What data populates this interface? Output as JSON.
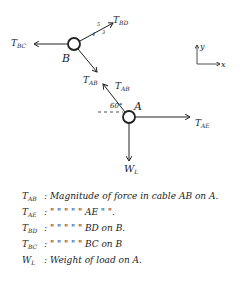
{
  "diagram": {
    "nodes": {
      "B": {
        "label": "B"
      },
      "A": {
        "label": "A"
      }
    },
    "forces_B": {
      "T_BD": {
        "main": "T",
        "sub": "BD"
      },
      "T_BC": {
        "main": "T",
        "sub": "BC"
      },
      "T_AB": {
        "main": "T",
        "sub": "AB"
      },
      "slope": {
        "rise": "3",
        "run": "4",
        "hyp": "5"
      }
    },
    "forces_A": {
      "T_AB": {
        "main": "T",
        "sub": "AB"
      },
      "T_AE": {
        "main": "T",
        "sub": "AE"
      },
      "W_L": {
        "main": "W",
        "sub": "L"
      },
      "angle": "60°"
    },
    "axes": {
      "x": "x",
      "y": "y"
    }
  },
  "legend": [
    {
      "sym": "T",
      "sub": "AB",
      "text": ": Magnitude of force in cable AB on A."
    },
    {
      "sym": "T",
      "sub": "AE",
      "text": ":    \"      \"     \"    \"    \"   AE   \"  \"."
    },
    {
      "sym": "T",
      "sub": "BD",
      "text": ":    \"      \"     \"    \"    \"  BD on B."
    },
    {
      "sym": "T",
      "sub": "BC",
      "text": ":    \"      \"     \"    \"    \"  BC on B"
    },
    {
      "sym": "W",
      "sub": "L",
      "text": ": Weight of load on A."
    }
  ]
}
